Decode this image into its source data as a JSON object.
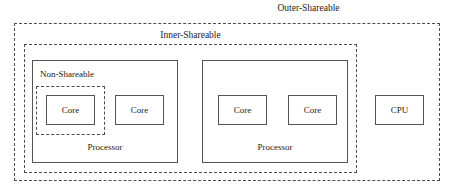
{
  "diagram": {
    "type": "nested-containment-diagram",
    "domains": {
      "outer": {
        "label": "Outer-Shareable",
        "border_style": "dashed"
      },
      "inner": {
        "label": "Inner-Shareable",
        "border_style": "dashed"
      },
      "non_shareable": {
        "label": "Non-Shareable",
        "border_style": "dashed"
      }
    },
    "processors": [
      {
        "label": "Processor",
        "cores": [
          {
            "label": "Core"
          },
          {
            "label": "Core"
          }
        ]
      },
      {
        "label": "Processor",
        "cores": [
          {
            "label": "Core"
          },
          {
            "label": "Core"
          }
        ]
      }
    ],
    "standalone": {
      "label": "CPU"
    },
    "colors": {
      "background": "#ffffff",
      "solid_border": "#555555",
      "dashed_border": "#4d4d4d",
      "text": "#1a1a1a"
    }
  }
}
